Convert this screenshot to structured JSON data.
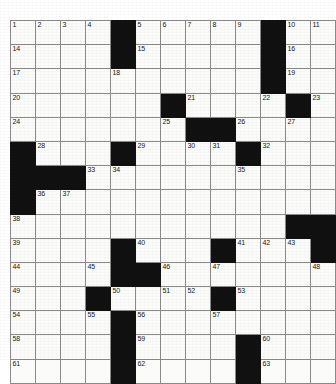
{
  "puzzle": {
    "title": "Crossword Grid",
    "columns": 13,
    "rows": 14,
    "colors": {
      "block": "#111111",
      "cell": "#fbfbf9",
      "gridline": "#8a8a8a",
      "number": "#16181a",
      "page": "#ffffff"
    },
    "grid": [
      [
        {
          "type": "cell",
          "number": "1"
        },
        {
          "type": "cell",
          "number": "2"
        },
        {
          "type": "cell",
          "number": "3"
        },
        {
          "type": "cell",
          "number": "4"
        },
        {
          "type": "block",
          "number": ""
        },
        {
          "type": "cell",
          "number": "5"
        },
        {
          "type": "cell",
          "number": "6"
        },
        {
          "type": "cell",
          "number": "7"
        },
        {
          "type": "cell",
          "number": "8"
        },
        {
          "type": "cell",
          "number": "9"
        },
        {
          "type": "block",
          "number": ""
        },
        {
          "type": "cell",
          "number": "10"
        },
        {
          "type": "cell",
          "number": "11"
        },
        {
          "type": "cell",
          "number": "12"
        },
        {
          "type": "cell",
          "number": "13"
        }
      ],
      [
        {
          "type": "cell",
          "number": "14"
        },
        {
          "type": "cell",
          "number": ""
        },
        {
          "type": "cell",
          "number": ""
        },
        {
          "type": "cell",
          "number": ""
        },
        {
          "type": "block",
          "number": ""
        },
        {
          "type": "cell",
          "number": "15"
        },
        {
          "type": "cell",
          "number": ""
        },
        {
          "type": "cell",
          "number": ""
        },
        {
          "type": "cell",
          "number": ""
        },
        {
          "type": "cell",
          "number": ""
        },
        {
          "type": "block",
          "number": ""
        },
        {
          "type": "cell",
          "number": "16"
        },
        {
          "type": "cell",
          "number": ""
        },
        {
          "type": "cell",
          "number": ""
        },
        {
          "type": "cell",
          "number": ""
        }
      ],
      [
        {
          "type": "cell",
          "number": "17"
        },
        {
          "type": "cell",
          "number": ""
        },
        {
          "type": "cell",
          "number": ""
        },
        {
          "type": "cell",
          "number": ""
        },
        {
          "type": "cell",
          "number": "18"
        },
        {
          "type": "cell",
          "number": ""
        },
        {
          "type": "cell",
          "number": ""
        },
        {
          "type": "cell",
          "number": ""
        },
        {
          "type": "cell",
          "number": ""
        },
        {
          "type": "cell",
          "number": ""
        },
        {
          "type": "block",
          "number": ""
        },
        {
          "type": "cell",
          "number": "19"
        },
        {
          "type": "cell",
          "number": ""
        },
        {
          "type": "cell",
          "number": ""
        },
        {
          "type": "cell",
          "number": ""
        }
      ],
      [
        {
          "type": "cell",
          "number": "20"
        },
        {
          "type": "cell",
          "number": ""
        },
        {
          "type": "cell",
          "number": ""
        },
        {
          "type": "cell",
          "number": ""
        },
        {
          "type": "cell",
          "number": ""
        },
        {
          "type": "cell",
          "number": ""
        },
        {
          "type": "block",
          "number": ""
        },
        {
          "type": "cell",
          "number": "21"
        },
        {
          "type": "cell",
          "number": ""
        },
        {
          "type": "cell",
          "number": ""
        },
        {
          "type": "cell",
          "number": "22"
        },
        {
          "type": "block",
          "number": ""
        },
        {
          "type": "cell",
          "number": "23"
        },
        {
          "type": "cell",
          "number": ""
        },
        {
          "type": "cell",
          "number": ""
        }
      ],
      [
        {
          "type": "cell",
          "number": "24"
        },
        {
          "type": "cell",
          "number": ""
        },
        {
          "type": "cell",
          "number": ""
        },
        {
          "type": "cell",
          "number": ""
        },
        {
          "type": "cell",
          "number": ""
        },
        {
          "type": "cell",
          "number": ""
        },
        {
          "type": "cell",
          "number": "25"
        },
        {
          "type": "block",
          "number": ""
        },
        {
          "type": "block",
          "number": ""
        },
        {
          "type": "cell",
          "number": "26"
        },
        {
          "type": "cell",
          "number": ""
        },
        {
          "type": "cell",
          "number": "27"
        },
        {
          "type": "cell",
          "number": ""
        },
        {
          "type": "cell",
          "number": ""
        },
        {
          "type": "cell",
          "number": ""
        }
      ],
      [
        {
          "type": "block",
          "number": ""
        },
        {
          "type": "cell",
          "number": "28"
        },
        {
          "type": "cell",
          "number": ""
        },
        {
          "type": "cell",
          "number": ""
        },
        {
          "type": "block",
          "number": ""
        },
        {
          "type": "cell",
          "number": "29"
        },
        {
          "type": "cell",
          "number": ""
        },
        {
          "type": "cell",
          "number": "30"
        },
        {
          "type": "cell",
          "number": "31"
        },
        {
          "type": "block",
          "number": ""
        },
        {
          "type": "cell",
          "number": "32"
        },
        {
          "type": "cell",
          "number": ""
        },
        {
          "type": "cell",
          "number": ""
        },
        {
          "type": "cell",
          "number": ""
        },
        {
          "type": "cell",
          "number": ""
        }
      ],
      [
        {
          "type": "block",
          "number": ""
        },
        {
          "type": "block",
          "number": ""
        },
        {
          "type": "block",
          "number": ""
        },
        {
          "type": "cell",
          "number": "33"
        },
        {
          "type": "cell",
          "number": "34"
        },
        {
          "type": "cell",
          "number": ""
        },
        {
          "type": "cell",
          "number": ""
        },
        {
          "type": "cell",
          "number": ""
        },
        {
          "type": "cell",
          "number": ""
        },
        {
          "type": "cell",
          "number": "35"
        },
        {
          "type": "cell",
          "number": ""
        },
        {
          "type": "cell",
          "number": ""
        },
        {
          "type": "cell",
          "number": ""
        },
        {
          "type": "cell",
          "number": ""
        },
        {
          "type": "cell",
          "number": ""
        }
      ],
      [
        {
          "type": "block",
          "number": ""
        },
        {
          "type": "cell",
          "number": "36"
        },
        {
          "type": "cell",
          "number": "37"
        },
        {
          "type": "cell",
          "number": ""
        },
        {
          "type": "cell",
          "number": ""
        },
        {
          "type": "cell",
          "number": ""
        },
        {
          "type": "cell",
          "number": ""
        },
        {
          "type": "cell",
          "number": ""
        },
        {
          "type": "cell",
          "number": ""
        },
        {
          "type": "cell",
          "number": ""
        },
        {
          "type": "cell",
          "number": ""
        },
        {
          "type": "cell",
          "number": ""
        },
        {
          "type": "cell",
          "number": ""
        },
        {
          "type": "block",
          "number": ""
        }
      ],
      [
        {
          "type": "cell",
          "number": "38"
        },
        {
          "type": "cell",
          "number": ""
        },
        {
          "type": "cell",
          "number": ""
        },
        {
          "type": "cell",
          "number": ""
        },
        {
          "type": "cell",
          "number": ""
        },
        {
          "type": "cell",
          "number": ""
        },
        {
          "type": "cell",
          "number": ""
        },
        {
          "type": "cell",
          "number": ""
        },
        {
          "type": "cell",
          "number": ""
        },
        {
          "type": "cell",
          "number": ""
        },
        {
          "type": "cell",
          "number": ""
        },
        {
          "type": "block",
          "number": ""
        },
        {
          "type": "block",
          "number": ""
        }
      ],
      [
        {
          "type": "cell",
          "number": "39"
        },
        {
          "type": "cell",
          "number": ""
        },
        {
          "type": "cell",
          "number": ""
        },
        {
          "type": "cell",
          "number": ""
        },
        {
          "type": "block",
          "number": ""
        },
        {
          "type": "cell",
          "number": "40"
        },
        {
          "type": "cell",
          "number": ""
        },
        {
          "type": "cell",
          "number": ""
        },
        {
          "type": "block",
          "number": ""
        },
        {
          "type": "cell",
          "number": "41"
        },
        {
          "type": "cell",
          "number": "42"
        },
        {
          "type": "cell",
          "number": "43"
        },
        {
          "type": "block",
          "number": ""
        }
      ],
      [
        {
          "type": "cell",
          "number": "44"
        },
        {
          "type": "cell",
          "number": ""
        },
        {
          "type": "cell",
          "number": ""
        },
        {
          "type": "cell",
          "number": "45"
        },
        {
          "type": "block",
          "number": ""
        },
        {
          "type": "block",
          "number": ""
        },
        {
          "type": "cell",
          "number": "46"
        },
        {
          "type": "cell",
          "number": ""
        },
        {
          "type": "cell",
          "number": "47"
        },
        {
          "type": "cell",
          "number": ""
        },
        {
          "type": "cell",
          "number": ""
        },
        {
          "type": "cell",
          "number": ""
        },
        {
          "type": "cell",
          "number": "48"
        }
      ],
      [
        {
          "type": "cell",
          "number": "49"
        },
        {
          "type": "cell",
          "number": ""
        },
        {
          "type": "cell",
          "number": ""
        },
        {
          "type": "block",
          "number": ""
        },
        {
          "type": "cell",
          "number": "50"
        },
        {
          "type": "cell",
          "number": ""
        },
        {
          "type": "cell",
          "number": "51"
        },
        {
          "type": "cell",
          "number": "52"
        },
        {
          "type": "block",
          "number": ""
        },
        {
          "type": "cell",
          "number": "53"
        },
        {
          "type": "cell",
          "number": ""
        },
        {
          "type": "cell",
          "number": ""
        },
        {
          "type": "cell",
          "number": ""
        }
      ],
      [
        {
          "type": "cell",
          "number": "54"
        },
        {
          "type": "cell",
          "number": ""
        },
        {
          "type": "cell",
          "number": ""
        },
        {
          "type": "cell",
          "number": "55"
        },
        {
          "type": "block",
          "number": ""
        },
        {
          "type": "cell",
          "number": "56"
        },
        {
          "type": "cell",
          "number": ""
        },
        {
          "type": "cell",
          "number": ""
        },
        {
          "type": "cell",
          "number": "57"
        },
        {
          "type": "cell",
          "number": ""
        },
        {
          "type": "cell",
          "number": ""
        },
        {
          "type": "cell",
          "number": ""
        },
        {
          "type": "cell",
          "number": ""
        }
      ],
      [
        {
          "type": "cell",
          "number": "58"
        },
        {
          "type": "cell",
          "number": ""
        },
        {
          "type": "cell",
          "number": ""
        },
        {
          "type": "cell",
          "number": ""
        },
        {
          "type": "block",
          "number": ""
        },
        {
          "type": "cell",
          "number": "59"
        },
        {
          "type": "cell",
          "number": ""
        },
        {
          "type": "cell",
          "number": ""
        },
        {
          "type": "cell",
          "number": ""
        },
        {
          "type": "block",
          "number": ""
        },
        {
          "type": "cell",
          "number": "60"
        },
        {
          "type": "cell",
          "number": ""
        },
        {
          "type": "cell",
          "number": ""
        },
        {
          "type": "cell",
          "number": ""
        }
      ],
      [
        {
          "type": "cell",
          "number": "61"
        },
        {
          "type": "cell",
          "number": ""
        },
        {
          "type": "cell",
          "number": ""
        },
        {
          "type": "cell",
          "number": ""
        },
        {
          "type": "block",
          "number": ""
        },
        {
          "type": "cell",
          "number": "62"
        },
        {
          "type": "cell",
          "number": ""
        },
        {
          "type": "cell",
          "number": ""
        },
        {
          "type": "cell",
          "number": ""
        },
        {
          "type": "block",
          "number": ""
        },
        {
          "type": "cell",
          "number": "63"
        },
        {
          "type": "cell",
          "number": ""
        },
        {
          "type": "cell",
          "number": ""
        },
        {
          "type": "cell",
          "number": ""
        }
      ]
    ]
  }
}
